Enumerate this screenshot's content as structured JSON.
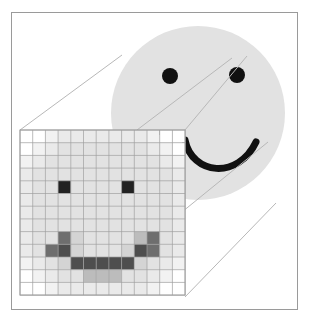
{
  "figure": {
    "width": 310,
    "height": 322,
    "background_color": "#ffffff"
  },
  "frame": {
    "name": "outer-border",
    "x": 11,
    "y": 12,
    "width": 287,
    "height": 298,
    "stroke_color": "#9a9a9a",
    "stroke_width": 1,
    "fill_color": "#ffffff"
  },
  "face": {
    "name": "smiley-face",
    "circle": {
      "cx": 198,
      "cy": 113,
      "r": 87,
      "fill_color": "#e2e2e2"
    },
    "left_eye": {
      "cx": 170,
      "cy": 76,
      "r": 8,
      "fill_color": "#111111"
    },
    "right_eye": {
      "cx": 237,
      "cy": 75,
      "r": 8,
      "fill_color": "#111111"
    },
    "mouth": {
      "path": "M 185 140 C 192 175, 238 180, 256 142",
      "stroke_color": "#111111",
      "stroke_width": 7,
      "fill": "none"
    },
    "nose_mark": {
      "x": 155,
      "y": 130,
      "width": 9,
      "height": 5,
      "fill_color": "#111111"
    }
  },
  "magnifier_lines": {
    "name": "magnification-connector-lines",
    "stroke_color": "#b8b8b8",
    "stroke_width": 1,
    "segments": [
      {
        "x1": 20,
        "y1": 130,
        "x2": 122,
        "y2": 55
      },
      {
        "x1": 185,
        "y1": 130,
        "x2": 247,
        "y2": 56
      },
      {
        "x1": 185,
        "y1": 297,
        "x2": 276,
        "y2": 203
      },
      {
        "x1": 137,
        "y1": 130,
        "x2": 232,
        "y2": 58
      },
      {
        "x1": 150,
        "y1": 238,
        "x2": 268,
        "y2": 142
      }
    ]
  },
  "pixel_grid": {
    "name": "magnified-pixel-grid",
    "x": 20,
    "y": 130,
    "cell_size": 12.7,
    "columns": 13,
    "rows": 13,
    "gridline_color": "#9e9e9e",
    "gridline_width": 0.7,
    "palette": {
      "white": "#ffffff",
      "lightest": "#f2f2f2",
      "light": "#eaeaea",
      "base": "#e2e2e2",
      "mid": "#d4d4d4",
      "mid_dark": "#bcbcbc",
      "gray": "#9a9a9a",
      "dark": "#6e6e6e",
      "darker": "#4e4e4e",
      "black": "#222222"
    },
    "cells": [
      [
        "white",
        "white",
        "lightest",
        "light",
        "light",
        "light",
        "light",
        "light",
        "light",
        "light",
        "lightest",
        "white",
        "white"
      ],
      [
        "white",
        "lightest",
        "light",
        "base",
        "base",
        "base",
        "base",
        "base",
        "base",
        "base",
        "light",
        "lightest",
        "white"
      ],
      [
        "lightest",
        "light",
        "base",
        "base",
        "base",
        "base",
        "base",
        "base",
        "base",
        "base",
        "base",
        "light",
        "lightest"
      ],
      [
        "light",
        "base",
        "base",
        "base",
        "base",
        "base",
        "base",
        "base",
        "base",
        "base",
        "base",
        "base",
        "light"
      ],
      [
        "light",
        "base",
        "base",
        "black",
        "base",
        "base",
        "base",
        "base",
        "black",
        "base",
        "base",
        "base",
        "light"
      ],
      [
        "light",
        "base",
        "base",
        "base",
        "base",
        "base",
        "base",
        "base",
        "base",
        "base",
        "base",
        "base",
        "light"
      ],
      [
        "light",
        "base",
        "base",
        "base",
        "base",
        "base",
        "base",
        "base",
        "base",
        "base",
        "base",
        "base",
        "light"
      ],
      [
        "light",
        "base",
        "base",
        "base",
        "base",
        "base",
        "base",
        "base",
        "base",
        "base",
        "base",
        "base",
        "light"
      ],
      [
        "light",
        "base",
        "base",
        "dark",
        "mid",
        "base",
        "base",
        "base",
        "base",
        "mid_dark",
        "dark",
        "base",
        "light"
      ],
      [
        "light",
        "base",
        "dark",
        "darker",
        "mid",
        "base",
        "base",
        "base",
        "mid",
        "darker",
        "dark",
        "base",
        "light"
      ],
      [
        "lightest",
        "light",
        "base",
        "mid",
        "darker",
        "darker",
        "darker",
        "darker",
        "darker",
        "mid",
        "base",
        "light",
        "lightest"
      ],
      [
        "white",
        "lightest",
        "light",
        "base",
        "base",
        "mid_dark",
        "mid_dark",
        "mid_dark",
        "base",
        "base",
        "light",
        "lightest",
        "white"
      ],
      [
        "white",
        "white",
        "lightest",
        "light",
        "light",
        "light",
        "light",
        "light",
        "light",
        "light",
        "lightest",
        "white",
        "white"
      ]
    ]
  }
}
